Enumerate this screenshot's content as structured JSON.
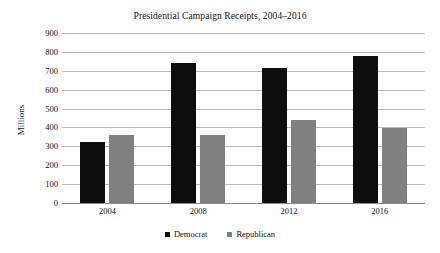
{
  "chart_data": {
    "type": "bar",
    "title": "Presidential Campaign Receipts, 2004–2016",
    "xlabel": "",
    "ylabel": "Millions",
    "categories": [
      "2004",
      "2008",
      "2012",
      "2016"
    ],
    "series": [
      {
        "name": "Democrat",
        "color": "#0d0d0d",
        "values": [
          325,
          740,
          715,
          780
        ]
      },
      {
        "name": "Republican",
        "color": "#808080",
        "values": [
          360,
          360,
          440,
          395
        ]
      }
    ],
    "ylim": [
      0,
      900
    ],
    "ytick_step": 100,
    "yticks": [
      "900",
      "800",
      "700",
      "600",
      "500",
      "400",
      "300",
      "200",
      "100",
      "0"
    ],
    "grid": true,
    "legend_position": "bottom"
  },
  "legend": {
    "entries": [
      {
        "label": "Democrat",
        "marker": "square-marker"
      },
      {
        "label": "Republican",
        "marker": "square-marker"
      }
    ]
  }
}
